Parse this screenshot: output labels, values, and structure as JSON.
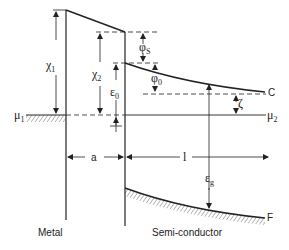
{
  "diagram": {
    "regions": {
      "metal": "Metal",
      "semiconductor": "Semi-conductor"
    },
    "labels": {
      "chi1": "χ",
      "chi1_sub": "1",
      "chi2": "χ",
      "chi2_sub": "2",
      "phi_s": "φ",
      "phi_s_sub": "S",
      "phi_0": "φ",
      "phi_0_sub": "0",
      "eps_0": "ε",
      "eps_0_sub": "0",
      "mu1": "μ",
      "mu1_sub": "1",
      "mu2": "μ",
      "mu2_sub": "2",
      "zeta": "ζ",
      "conduction_band": "C",
      "valence_band": "F",
      "gap_width": "a",
      "depletion_length": "l",
      "eps_g": "ε",
      "eps_g_sub": "g"
    },
    "colors": {
      "line": "#222222",
      "background": "#ffffff"
    }
  }
}
